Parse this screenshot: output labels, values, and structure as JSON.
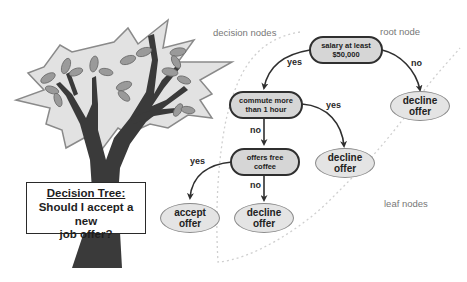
{
  "title": {
    "line1": "Decision Tree:",
    "line2": "Should I accept a new",
    "line3": "job offer?"
  },
  "region_labels": {
    "decision_nodes": "decision nodes",
    "root_node": "root node",
    "leaf_nodes": "leaf nodes"
  },
  "nodes": {
    "root": {
      "line1": "salary at least",
      "line2": "$50,000"
    },
    "commute": {
      "line1": "commute more",
      "line2": "than 1 hour"
    },
    "coffee": {
      "line1": "offers free",
      "line2": "coffee"
    },
    "leaf_decline_1": {
      "line1": "decline",
      "line2": "offer"
    },
    "leaf_decline_2": {
      "line1": "decline",
      "line2": "offer"
    },
    "leaf_accept": {
      "line1": "accept",
      "line2": "offer"
    },
    "leaf_decline_3": {
      "line1": "decline",
      "line2": "offer"
    }
  },
  "edges": {
    "root_yes": "yes",
    "root_no": "no",
    "commute_yes": "yes",
    "commute_no": "no",
    "coffee_yes": "yes",
    "coffee_no": "no"
  },
  "colors": {
    "decision_fill": "#d6d6d6",
    "leaf_fill": "#e4e4e4",
    "line": "#2f2f2f",
    "dotted_boundary": "#cfcfcf",
    "tree_foliage": "#e2e2e2",
    "tree_trunk": "#3a3a3a",
    "leaf_green_gray": "#9a9a9a"
  }
}
